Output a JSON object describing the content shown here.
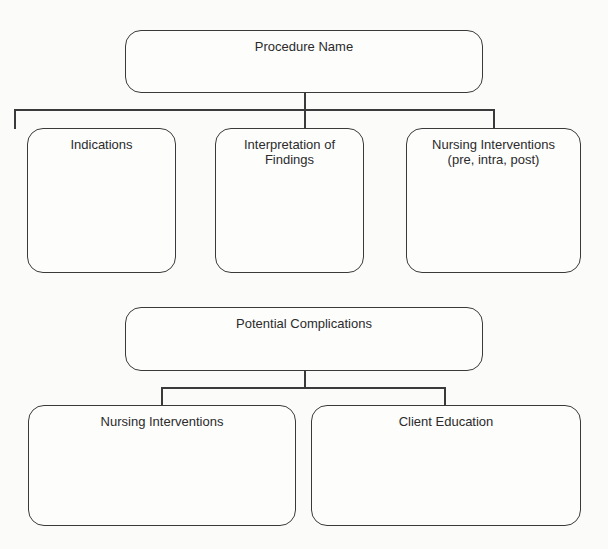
{
  "diagram": {
    "section1": {
      "root": {
        "label": "Procedure Name"
      },
      "children": [
        {
          "label": "Indications"
        },
        {
          "label": "Interpretation of\nFindings"
        },
        {
          "label": "Nursing Interventions\n(pre, intra, post)"
        }
      ]
    },
    "section2": {
      "root": {
        "label": "Potential Complications"
      },
      "children": [
        {
          "label": "Nursing Interventions"
        },
        {
          "label": "Client Education"
        }
      ]
    }
  },
  "colors": {
    "stroke": "#3a3a3a",
    "background": "#fbfbfa"
  }
}
